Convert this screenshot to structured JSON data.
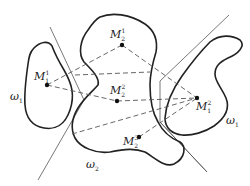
{
  "diagram": {
    "type": "class-regions-with-prototypes",
    "regions": [
      {
        "id": "omega1-left",
        "label": "ω",
        "sub": "1"
      },
      {
        "id": "omega2-center",
        "label": "ω",
        "sub": "2"
      },
      {
        "id": "omega1-right",
        "label": "ω",
        "sub": "1"
      }
    ],
    "points": [
      {
        "id": "M1_1",
        "label": "M",
        "sub": "1",
        "sup": "1"
      },
      {
        "id": "M2_1",
        "label": "M",
        "sub": "2",
        "sup": "1"
      },
      {
        "id": "M2_2",
        "label": "M",
        "sub": "2",
        "sup": "2"
      },
      {
        "id": "M1_2",
        "label": "M",
        "sub": "1",
        "sup": "2"
      },
      {
        "id": "M2_3",
        "label": "M",
        "sub": "2",
        "sup": "3"
      }
    ],
    "connections": [
      [
        "M1_1",
        "M2_1"
      ],
      [
        "M1_1",
        "M2_2"
      ],
      [
        "M2_1",
        "M1_2"
      ],
      [
        "M2_2",
        "M1_2"
      ],
      [
        "M2_3",
        "M1_2"
      ]
    ],
    "boundaries": [
      "left-decision-line",
      "right-decision-line"
    ]
  }
}
